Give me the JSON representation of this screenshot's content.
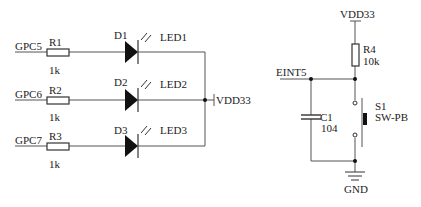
{
  "diagram": {
    "type": "circuit-schematic",
    "colors": {
      "wire": "#555555",
      "ink": "#222222",
      "background": "#ffffff"
    },
    "led_section": {
      "rows": [
        {
          "net": "GPC5",
          "resistor": {
            "ref": "R1",
            "value": "1k"
          },
          "diode": {
            "ref": "D1",
            "label": "LED1"
          }
        },
        {
          "net": "GPC6",
          "resistor": {
            "ref": "R2",
            "value": "1k"
          },
          "diode": {
            "ref": "D2",
            "label": "LED2"
          }
        },
        {
          "net": "GPC7",
          "resistor": {
            "ref": "R3",
            "value": "1k"
          },
          "diode": {
            "ref": "D3",
            "label": "LED3"
          }
        }
      ],
      "supply": "VDD33"
    },
    "button_section": {
      "supply": "VDD33",
      "pullup": {
        "ref": "R4",
        "value": "10k"
      },
      "net": "EINT5",
      "capacitor": {
        "ref": "C1",
        "value": "104"
      },
      "switch": {
        "ref": "S1",
        "type": "SW-PB"
      },
      "ground": "GND"
    }
  }
}
